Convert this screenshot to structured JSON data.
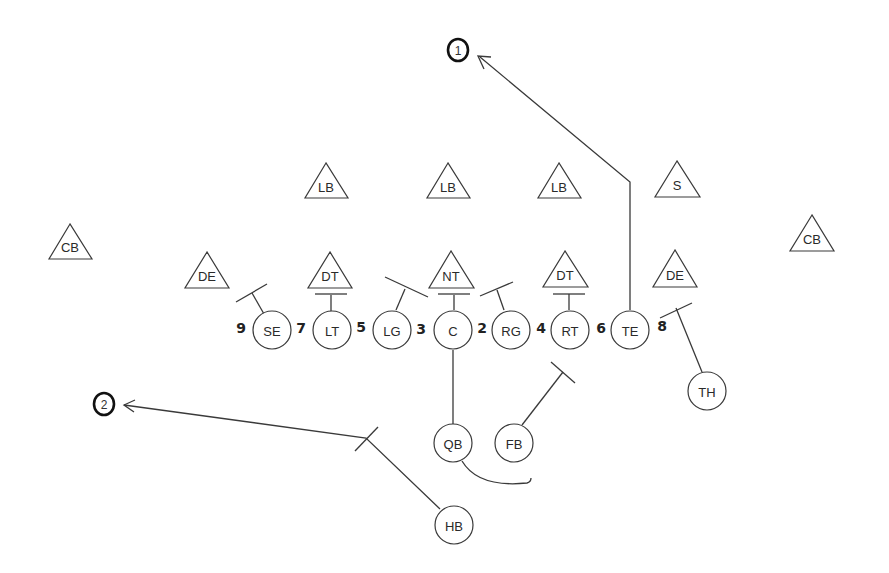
{
  "diagram": {
    "type": "football-play",
    "colors": {
      "ink": "#3a3a3a",
      "background": "#ffffff"
    },
    "defense": [
      {
        "id": "cb-left",
        "label": "CB",
        "x": 70,
        "y": 246
      },
      {
        "id": "de-left",
        "label": "DE",
        "x": 207,
        "y": 275
      },
      {
        "id": "lb-left",
        "label": "LB",
        "x": 326,
        "y": 185
      },
      {
        "id": "dt-left",
        "label": "DT",
        "x": 330,
        "y": 275
      },
      {
        "id": "lb-mid",
        "label": "LB",
        "x": 448,
        "y": 185
      },
      {
        "id": "nt",
        "label": "NT",
        "x": 451,
        "y": 275
      },
      {
        "id": "lb-right",
        "label": "LB",
        "x": 559,
        "y": 185
      },
      {
        "id": "dt-right",
        "label": "DT",
        "x": 565,
        "y": 275
      },
      {
        "id": "s",
        "label": "S",
        "x": 677,
        "y": 183
      },
      {
        "id": "de-right",
        "label": "DE",
        "x": 675,
        "y": 273
      },
      {
        "id": "cb-right",
        "label": "CB",
        "x": 812,
        "y": 238
      }
    ],
    "offense": [
      {
        "id": "se",
        "label": "SE",
        "x": 272,
        "y": 330
      },
      {
        "id": "lt",
        "label": "LT",
        "x": 332,
        "y": 330
      },
      {
        "id": "lg",
        "label": "LG",
        "x": 392,
        "y": 330
      },
      {
        "id": "c",
        "label": "C",
        "x": 452,
        "y": 330
      },
      {
        "id": "rg",
        "label": "RG",
        "x": 510,
        "y": 330
      },
      {
        "id": "rt",
        "label": "RT",
        "x": 570,
        "y": 330
      },
      {
        "id": "te",
        "label": "TE",
        "x": 630,
        "y": 330
      },
      {
        "id": "th",
        "label": "TH",
        "x": 707,
        "y": 390
      },
      {
        "id": "qb",
        "label": "QB",
        "x": 452,
        "y": 442
      },
      {
        "id": "fb",
        "label": "FB",
        "x": 514,
        "y": 442
      },
      {
        "id": "hb",
        "label": "HB",
        "x": 453,
        "y": 524
      }
    ],
    "holes": [
      {
        "label": "9",
        "x": 241,
        "y": 328
      },
      {
        "label": "7",
        "x": 301,
        "y": 328
      },
      {
        "label": "5",
        "x": 361,
        "y": 328
      },
      {
        "label": "3",
        "x": 421,
        "y": 328
      },
      {
        "label": "2",
        "x": 482,
        "y": 328
      },
      {
        "label": "4",
        "x": 541,
        "y": 328
      },
      {
        "label": "6",
        "x": 601,
        "y": 328
      },
      {
        "label": "8",
        "x": 662,
        "y": 326
      }
    ],
    "targets": [
      {
        "id": "receiver-1",
        "label": "1",
        "x": 458,
        "y": 50
      },
      {
        "id": "receiver-2",
        "label": "2",
        "x": 104,
        "y": 404
      }
    ]
  }
}
